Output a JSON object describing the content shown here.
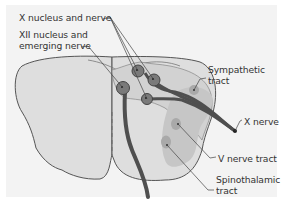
{
  "diagram": {
    "labels": {
      "x_nucleus": "X nucleus and nerve",
      "xii_nucleus_line1": "XII nucleus and",
      "xii_nucleus_line2": "emerging nerve",
      "sympathetic_line1": "Sympathetic",
      "sympathetic_line2": "tract",
      "x_nerve": "X nerve",
      "v_nerve_tract": "V nerve tract",
      "spinothalamic_line1": "Spinothalamic",
      "spinothalamic_line2": "tract"
    },
    "colors": {
      "background_panel": "#f3f3f3",
      "brainstem_fill": "#dedede",
      "highlight_region": "#c6c6c6",
      "nerve": "#555555",
      "nucleus": "#7a7a7a",
      "tract_spot": "#a9a9a9",
      "outline": "#555555"
    }
  }
}
